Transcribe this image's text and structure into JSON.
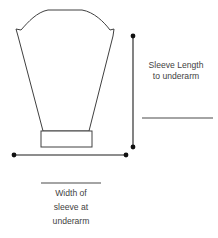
{
  "diagram": {
    "canvas": {
      "width": 218,
      "height": 238,
      "background": "#ffffff"
    },
    "colors": {
      "outline": "#404040",
      "dimension_line": "#1c1c1c",
      "rule_line": "#4a4a4a",
      "text": "#3f3f3f",
      "fill": "#ffffff"
    },
    "sleeve_shape": {
      "name": "sleeve-outline",
      "description": "Tapered sleeve with rounded sleeve cap, notched underarm corners, and straight cuff band",
      "cap_top_left_x": 48,
      "cap_top_right_x": 82,
      "cap_top_y": 10,
      "notch_left_x": 16,
      "notch_right_x": 114,
      "notch_y": 36,
      "underarm_left_x": 43,
      "underarm_right_x": 89,
      "underarm_y": 131,
      "path": "M 48 10 L 82 10 C 94 12 104 22 110 30 L 114 29 L 113 36 L 89 131 L 43 131 L 18 36 L 16 29 L 21 30 C 28 22 37 12 48 10 Z"
    },
    "cuff": {
      "name": "sleeve-cuff-band",
      "x": 41,
      "y": 131,
      "width": 51,
      "height": 16
    },
    "vertical_dimension": {
      "name": "sleeve-length-dimension",
      "x": 133,
      "y_top": 36,
      "y_bottom": 147,
      "dot_radius": 2.4
    },
    "horizontal_dimension": {
      "name": "sleeve-width-dimension",
      "y": 155,
      "x_left": 14,
      "x_right": 126,
      "dot_radius": 2.4
    },
    "length_label": {
      "name": "sleeve-length-label",
      "lines": [
        "Sleeve Length",
        "to underarm"
      ],
      "x": 176,
      "y_first": 68,
      "line_height": 11
    },
    "length_blank_rule": {
      "name": "sleeve-length-blank-rule",
      "x1": 142,
      "x2": 213,
      "y": 118
    },
    "width_blank_rule": {
      "name": "sleeve-width-blank-rule",
      "x1": 41,
      "x2": 101,
      "y": 183
    },
    "width_label": {
      "name": "sleeve-width-label",
      "lines": [
        "Width of",
        "sleeve at",
        "underarm"
      ],
      "x": 71,
      "y_first": 196,
      "line_height": 14
    }
  }
}
